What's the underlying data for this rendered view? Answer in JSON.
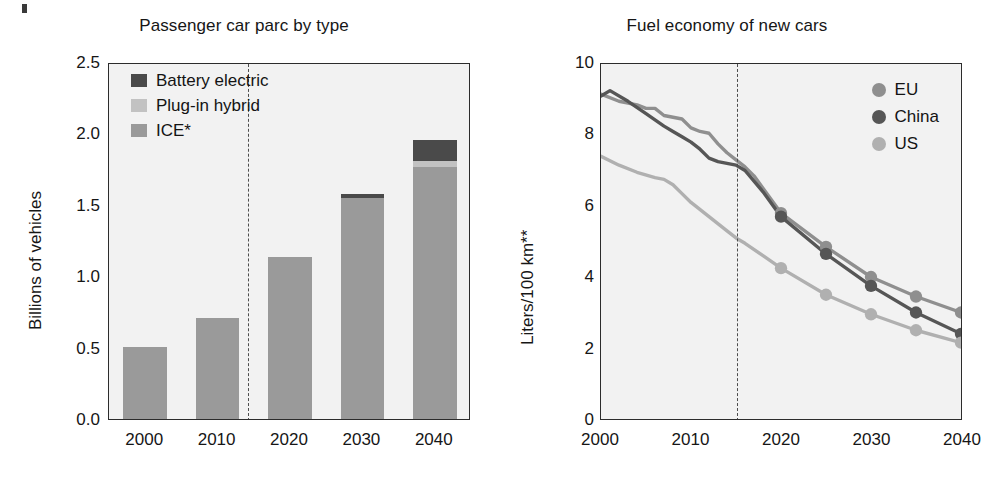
{
  "figure": {
    "background": "#ffffff",
    "panel_background": "#f2f2f2",
    "axis_color": "#2c2c2c"
  },
  "chart_data": [
    {
      "id": "passenger-car-parc",
      "type": "bar",
      "title": "Passenger car parc by type",
      "xlabel": "",
      "ylabel": "Billions of vehicles",
      "ylim": [
        0.0,
        2.5
      ],
      "yticks": [
        "0.0",
        "0.5",
        "1.0",
        "1.5",
        "2.0",
        "2.5"
      ],
      "ytick_values": [
        0.0,
        0.5,
        1.0,
        1.5,
        2.0,
        2.5
      ],
      "categories": [
        "2000",
        "2010",
        "2020",
        "2030",
        "2040"
      ],
      "category_values": [
        2000,
        2010,
        2020,
        2030,
        2040
      ],
      "stacked": true,
      "grid": false,
      "legend_position": "top-left",
      "series": [
        {
          "name": "ICE*",
          "color": "#9a9a9a",
          "values": [
            0.52,
            0.72,
            1.15,
            1.56,
            1.78
          ]
        },
        {
          "name": "Plug-in hybrid",
          "color": "#c2c2c2",
          "values": [
            0.0,
            0.0,
            0.0,
            0.0,
            0.04
          ]
        },
        {
          "name": "Battery electric",
          "color": "#4a4a4a",
          "values": [
            0.0,
            0.0,
            0.0,
            0.03,
            0.15
          ]
        }
      ],
      "totals": [
        0.52,
        0.72,
        1.15,
        1.59,
        1.97
      ],
      "legend_order": [
        "Battery electric",
        "Plug-in hybrid",
        "ICE*"
      ],
      "forecast_divider_x": 2015,
      "forecast_divider_label": ""
    },
    {
      "id": "fuel-economy-new-cars",
      "type": "line",
      "title": "Fuel economy of new cars",
      "xlabel": "",
      "ylabel": "Liters/100 km**",
      "ylim": [
        0,
        10
      ],
      "yticks": [
        "0",
        "2",
        "4",
        "6",
        "8",
        "10"
      ],
      "ytick_values": [
        0,
        2,
        4,
        6,
        8,
        10
      ],
      "xlim": [
        2000,
        2040
      ],
      "xticks": [
        "2000",
        "2010",
        "2020",
        "2030",
        "2040"
      ],
      "xtick_values": [
        2000,
        2010,
        2020,
        2030,
        2040
      ],
      "grid": false,
      "legend_position": "top-right",
      "forecast_divider_x": 2015,
      "series": [
        {
          "name": "EU",
          "color": "#8f8f8f",
          "marker": "circle",
          "points": [
            [
              2000,
              9.15
            ],
            [
              2002,
              8.95
            ],
            [
              2004,
              8.85
            ],
            [
              2005,
              8.75
            ],
            [
              2006,
              8.75
            ],
            [
              2007,
              8.55
            ],
            [
              2008,
              8.5
            ],
            [
              2009,
              8.45
            ],
            [
              2010,
              8.2
            ],
            [
              2011,
              8.1
            ],
            [
              2012,
              8.05
            ],
            [
              2013,
              7.75
            ],
            [
              2014,
              7.5
            ],
            [
              2015,
              7.3
            ],
            [
              2016,
              7.1
            ],
            [
              2017,
              6.85
            ],
            [
              2018,
              6.5
            ],
            [
              2020,
              5.8
            ],
            [
              2025,
              4.85
            ],
            [
              2030,
              4.0
            ],
            [
              2035,
              3.45
            ],
            [
              2040,
              3.0
            ]
          ],
          "marker_points": [
            [
              2020,
              5.8
            ],
            [
              2025,
              4.85
            ],
            [
              2030,
              4.0
            ],
            [
              2035,
              3.45
            ],
            [
              2040,
              3.0
            ]
          ]
        },
        {
          "name": "China",
          "color": "#565656",
          "marker": "circle",
          "points": [
            [
              2000,
              9.1
            ],
            [
              2001,
              9.25
            ],
            [
              2003,
              8.95
            ],
            [
              2005,
              8.6
            ],
            [
              2007,
              8.25
            ],
            [
              2008,
              8.1
            ],
            [
              2009,
              7.95
            ],
            [
              2010,
              7.8
            ],
            [
              2011,
              7.6
            ],
            [
              2012,
              7.35
            ],
            [
              2013,
              7.25
            ],
            [
              2014,
              7.2
            ],
            [
              2015,
              7.15
            ],
            [
              2016,
              7.0
            ],
            [
              2017,
              6.7
            ],
            [
              2018,
              6.4
            ],
            [
              2020,
              5.7
            ],
            [
              2025,
              4.65
            ],
            [
              2030,
              3.75
            ],
            [
              2035,
              3.0
            ],
            [
              2040,
              2.4
            ]
          ],
          "marker_points": [
            [
              2020,
              5.7
            ],
            [
              2025,
              4.65
            ],
            [
              2030,
              3.75
            ],
            [
              2035,
              3.0
            ],
            [
              2040,
              2.4
            ]
          ]
        },
        {
          "name": "US",
          "color": "#b0b0b0",
          "marker": "circle",
          "points": [
            [
              2000,
              7.4
            ],
            [
              2002,
              7.15
            ],
            [
              2004,
              6.95
            ],
            [
              2006,
              6.8
            ],
            [
              2007,
              6.75
            ],
            [
              2008,
              6.6
            ],
            [
              2009,
              6.35
            ],
            [
              2010,
              6.1
            ],
            [
              2012,
              5.7
            ],
            [
              2014,
              5.3
            ],
            [
              2015,
              5.1
            ],
            [
              2016,
              4.95
            ],
            [
              2018,
              4.6
            ],
            [
              2020,
              4.25
            ],
            [
              2025,
              3.5
            ],
            [
              2030,
              2.95
            ],
            [
              2035,
              2.5
            ],
            [
              2040,
              2.15
            ]
          ],
          "marker_points": [
            [
              2020,
              4.25
            ],
            [
              2025,
              3.5
            ],
            [
              2030,
              2.95
            ],
            [
              2035,
              2.5
            ],
            [
              2040,
              2.15
            ]
          ]
        }
      ]
    }
  ],
  "left_panel": {
    "title": "Passenger car parc by type",
    "ylabel": "Billions of vehicles",
    "legend": [
      {
        "label": "Battery electric",
        "color": "#4a4a4a"
      },
      {
        "label": "Plug-in hybrid",
        "color": "#c2c2c2"
      },
      {
        "label": "ICE*",
        "color": "#9a9a9a"
      }
    ],
    "yticks": [
      "2.5",
      "2.0",
      "1.5",
      "1.0",
      "0.5",
      "0.0"
    ],
    "xticks": [
      "2000",
      "2010",
      "2020",
      "2030",
      "2040"
    ]
  },
  "right_panel": {
    "title": "Fuel economy of new cars",
    "ylabel": "Liters/100 km**",
    "legend": [
      {
        "label": "EU",
        "color": "#8f8f8f"
      },
      {
        "label": "China",
        "color": "#565656"
      },
      {
        "label": "US",
        "color": "#b0b0b0"
      }
    ],
    "yticks": [
      "10",
      "8",
      "6",
      "4",
      "2",
      "0"
    ],
    "xticks": [
      "2000",
      "2010",
      "2020",
      "2030",
      "2040"
    ]
  }
}
